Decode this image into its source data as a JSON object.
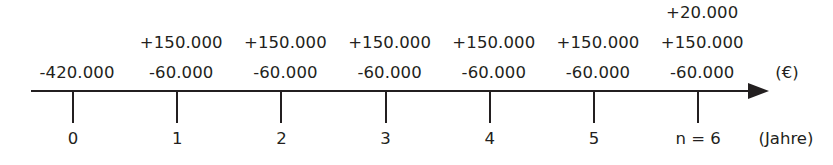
{
  "chart_data": {
    "type": "table",
    "title": "",
    "xlabel": "(Jahre)",
    "ylabel": "(€)",
    "categories": [
      "0",
      "1",
      "2",
      "3",
      "4",
      "5",
      "n = 6"
    ],
    "x": [
      0,
      1,
      2,
      3,
      4,
      5,
      6
    ],
    "series": [
      {
        "name": "Anschaffung / Restwert",
        "values": [
          -420000,
          null,
          null,
          null,
          null,
          null,
          20000
        ],
        "labels": [
          "-420.000",
          "",
          "",
          "",
          "",
          "",
          "+20.000"
        ]
      },
      {
        "name": "Einzahlungen",
        "values": [
          null,
          150000,
          150000,
          150000,
          150000,
          150000,
          150000
        ],
        "labels": [
          "",
          "+150.000",
          "+150.000",
          "+150.000",
          "+150.000",
          "+150.000",
          "+150.000"
        ]
      },
      {
        "name": "Auszahlungen",
        "values": [
          null,
          -60000,
          -60000,
          -60000,
          -60000,
          -60000,
          -60000
        ],
        "labels": [
          "",
          "-60.000",
          "-60.000",
          "-60.000",
          "-60.000",
          "-60.000",
          "-60.000"
        ]
      }
    ],
    "grid": false,
    "legend": "none",
    "axis_color": "#231f20"
  },
  "timeline": {
    "periods": [
      {
        "tick_label": "0",
        "top_label": "",
        "inflow_label": "",
        "outflow_label": "-420.000"
      },
      {
        "tick_label": "1",
        "top_label": "",
        "inflow_label": "+150.000",
        "outflow_label": "-60.000"
      },
      {
        "tick_label": "2",
        "top_label": "",
        "inflow_label": "+150.000",
        "outflow_label": "-60.000"
      },
      {
        "tick_label": "3",
        "top_label": "",
        "inflow_label": "+150.000",
        "outflow_label": "-60.000"
      },
      {
        "tick_label": "4",
        "top_label": "",
        "inflow_label": "+150.000",
        "outflow_label": "-60.000"
      },
      {
        "tick_label": "5",
        "top_label": "",
        "inflow_label": "+150.000",
        "outflow_label": "-60.000"
      },
      {
        "tick_label": "n = 6",
        "top_label": "+20.000",
        "inflow_label": "+150.000",
        "outflow_label": "-60.000"
      }
    ],
    "currency_unit": "(€)",
    "time_unit": "(Jahre)"
  }
}
